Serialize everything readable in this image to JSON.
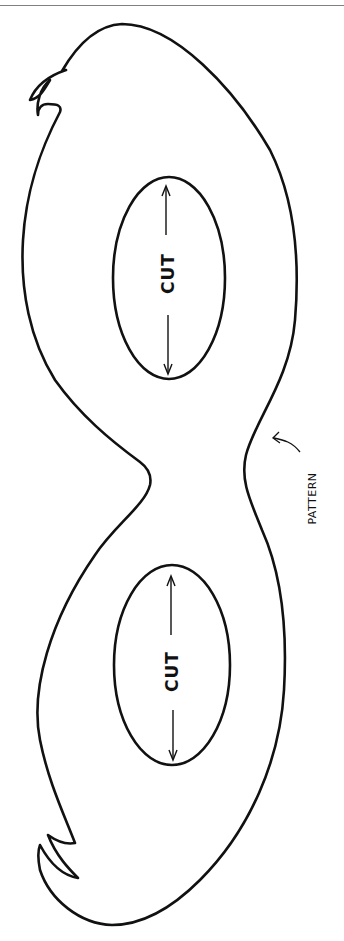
{
  "page": {
    "border_color": "#808080",
    "line_color": "#111111",
    "background": "#ffffff"
  },
  "eye_holes": [
    {
      "label": "CUT",
      "position": "upper",
      "arrows": [
        "up",
        "down"
      ]
    },
    {
      "label": "CUT",
      "position": "lower",
      "arrows": [
        "up",
        "down"
      ]
    }
  ],
  "annotation": {
    "label": "PATTERN",
    "arrow": "curved-arrow-pointing-to-outline"
  }
}
